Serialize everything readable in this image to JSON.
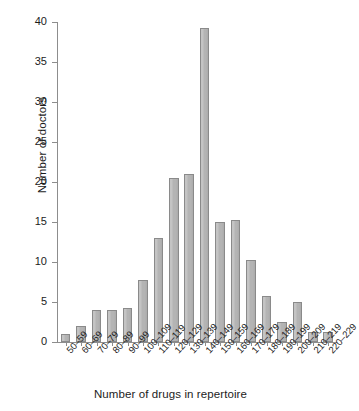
{
  "chart_data": {
    "type": "bar",
    "title": "",
    "xlabel": "Number of drugs in repertoire",
    "ylabel": "Number of doctors",
    "categories": [
      "50–59",
      "60–69",
      "70–79",
      "80–89",
      "90–99",
      "100–109",
      "110–119",
      "120–129",
      "130–139",
      "140–149",
      "150–159",
      "160–169",
      "170–179",
      "180–189",
      "190–199",
      "200–209",
      "210–219",
      "220–229"
    ],
    "values": [
      1,
      2,
      4,
      4,
      4.3,
      7.7,
      13,
      20.5,
      21,
      39.2,
      15,
      15.3,
      10.3,
      5.7,
      2.5,
      5,
      1.2,
      1.2
    ],
    "ylim": [
      0,
      40
    ],
    "yticks": [
      0,
      5,
      10,
      15,
      20,
      25,
      30,
      35,
      40
    ],
    "ytick_labels": [
      "0",
      "5",
      "10",
      "15",
      "20",
      "25",
      "30",
      "35",
      "40"
    ],
    "grid": false,
    "legend": null,
    "bar_fill_color": "#b4b4b4",
    "bar_edge_color": "#8a8a8a",
    "axis_color": "#8d8d8d",
    "background_color": "#ffffff"
  }
}
